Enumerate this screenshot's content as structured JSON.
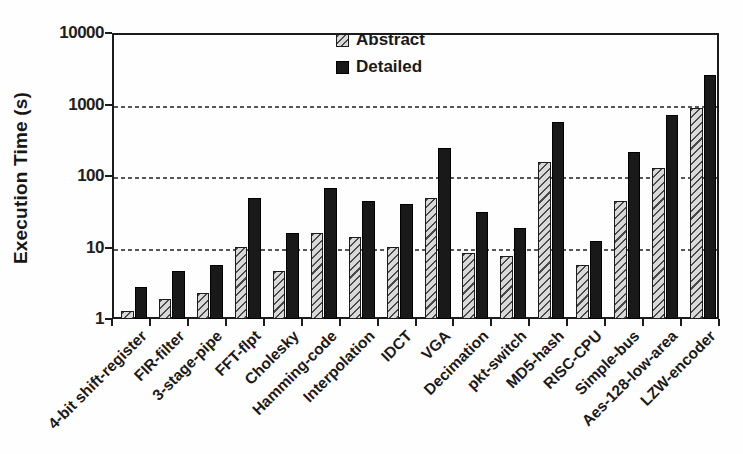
{
  "colors": {
    "background": "#fefefe",
    "axis": "#1c1c1c",
    "gridline": "#3a3a3a",
    "abstract_fill": "#d9d9d9",
    "abstract_hatch": "#4a4a4a",
    "detailed_fill": "#191919",
    "text": "#1a1a1a"
  },
  "chart_data": {
    "type": "bar",
    "title": "",
    "xlabel": "",
    "ylabel": "Execution Time (s)",
    "yscale": "log",
    "ylim": [
      1,
      10000
    ],
    "yticks": [
      1,
      10,
      100,
      1000,
      10000
    ],
    "ytick_labels": [
      "1",
      "10",
      "100",
      "1000",
      "10000"
    ],
    "grid": "horizontal dashed lines at 10, 100, 1000",
    "legend_position": "top-center-inside",
    "categories": [
      "4-bit shift-register",
      "FIR-filter",
      "3-stage-pipe",
      "FFT-flpt",
      "Cholesky",
      "Hamming-code",
      "Interpolation",
      "IDCT",
      "VGA",
      "Decimation",
      "pkt-switch",
      "MD5-hash",
      "RISC-CPU",
      "Simple-bus",
      "Aes-128-low-area",
      "LZW-encoder"
    ],
    "series": [
      {
        "name": "Abstract",
        "style": "hatched",
        "values": [
          1.4,
          2,
          2.5,
          11,
          5,
          17,
          15,
          11,
          52,
          9,
          8,
          170,
          6,
          48,
          140,
          950
        ]
      },
      {
        "name": "Detailed",
        "style": "solid",
        "values": [
          3,
          5,
          6,
          53,
          17,
          72,
          48,
          43,
          265,
          33,
          20,
          600,
          13,
          230,
          750,
          2800
        ]
      }
    ]
  }
}
